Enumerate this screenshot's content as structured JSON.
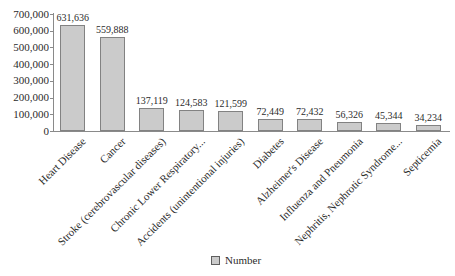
{
  "chart_data": {
    "type": "bar",
    "title": "",
    "xlabel": "",
    "ylabel": "",
    "categories": [
      "Heart Disease",
      "Cancer",
      "Stroke (cerebrovascular diseases)",
      "Chronic Lower Respiratory...",
      "Accidents (unintentional injuries)",
      "Diabetes",
      "Alzheimer's Disease",
      "Influenza and Pneumonia",
      "Nephritis, Nephrotic Syndrome...",
      "Septicemia"
    ],
    "series": [
      {
        "name": "Number",
        "values": [
          631636,
          559888,
          137119,
          124583,
          121599,
          72449,
          72432,
          56326,
          45344,
          34234
        ],
        "value_labels": [
          "631,636",
          "559,888",
          "137,119",
          "124,583",
          "121,599",
          "72,449",
          "72,432",
          "56,326",
          "45,344",
          "34,234"
        ]
      }
    ],
    "ylim": [
      0,
      700000
    ],
    "ytick_step": 100000,
    "ytick_labels": [
      "0",
      "100,000",
      "200,000",
      "300,000",
      "400,000",
      "500,000",
      "600,000",
      "700,000"
    ],
    "grid": false,
    "legend": {
      "label": "Number",
      "position": "bottom"
    },
    "colors": {
      "bar_fill": "#cbcbcb",
      "bar_border": "#828282",
      "axis": "#8a8a8a",
      "text": "#2b2b2b",
      "background": "#ffffff"
    }
  }
}
